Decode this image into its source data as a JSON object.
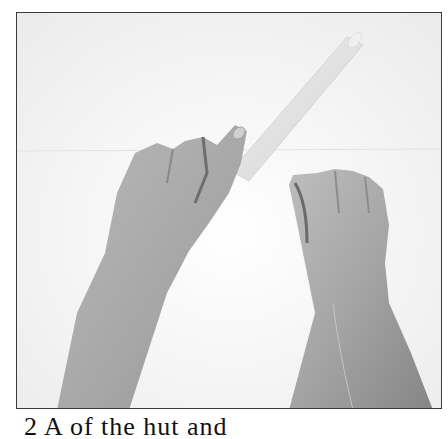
{
  "figure": {
    "colors": {
      "border": "#3a3a3a",
      "paper": "#f4f4f4",
      "skin_light": "#c9c9c9",
      "skin_mid": "#a8a8a8",
      "skin_dark": "#7d7d7d",
      "rod": "#e6e6e6"
    }
  },
  "caption": {
    "text": "2  A                    of the hut          and",
    "visibility": "partially clipped at bottom edge; only tops of glyphs visible"
  }
}
